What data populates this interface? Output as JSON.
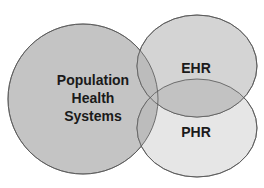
{
  "diagram": {
    "type": "venn",
    "sets": [
      {
        "id": "population",
        "label_lines": [
          "Population",
          "Health",
          "Systems"
        ],
        "fill": "#c4c4c4"
      },
      {
        "id": "ehr",
        "label_lines": [
          "EHR"
        ],
        "fill": "#d4d4d4"
      },
      {
        "id": "phr",
        "label_lines": [
          "PHR"
        ],
        "fill": "#e6e6e6"
      }
    ],
    "colors": {
      "stroke": "#555555",
      "overlap_pop_ehr": "#b8b8b8",
      "overlap_ehr_phr": "#bdbdbd",
      "overlap_pop_phr": "#bcbcbc"
    }
  }
}
